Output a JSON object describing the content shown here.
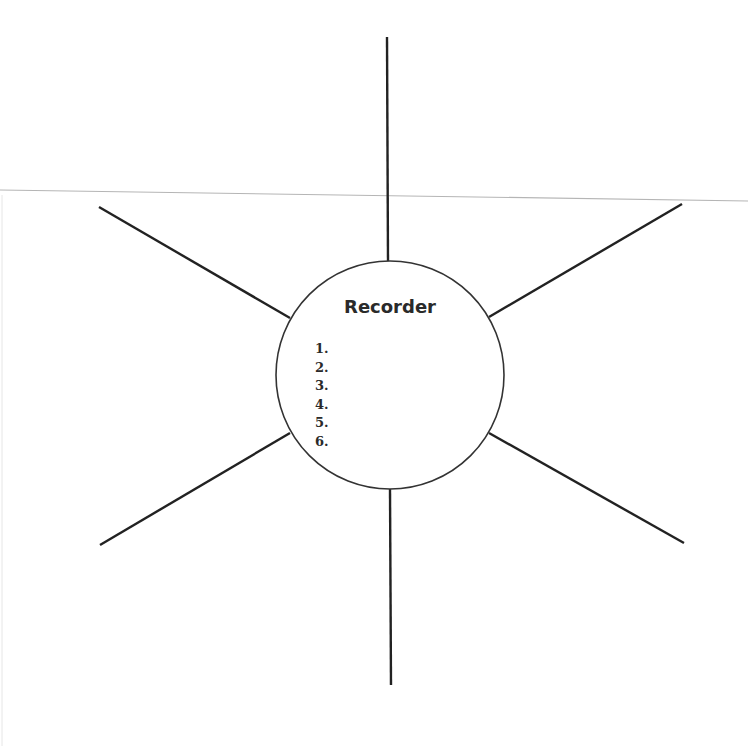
{
  "diagram": {
    "type": "graphic-organizer-web",
    "center": {
      "title": "Recorder",
      "items": [
        "1.",
        "2.",
        "3.",
        "4.",
        "5.",
        "6."
      ]
    },
    "spokes": [
      {
        "name": "top",
        "x1": 387,
        "y1": 37,
        "x2": 388,
        "y2": 261
      },
      {
        "name": "upper-right",
        "x1": 682,
        "y1": 204,
        "x2": 489,
        "y2": 317
      },
      {
        "name": "lower-right",
        "x1": 684,
        "y1": 543,
        "x2": 489,
        "y2": 433
      },
      {
        "name": "bottom",
        "x1": 390,
        "y1": 489,
        "x2": 391,
        "y2": 685
      },
      {
        "name": "lower-left",
        "x1": 100,
        "y1": 545,
        "x2": 290,
        "y2": 433
      },
      {
        "name": "upper-left",
        "x1": 99,
        "y1": 207,
        "x2": 290,
        "y2": 318
      }
    ],
    "circle": {
      "cx": 390,
      "cy": 375,
      "r": 114
    },
    "colors": {
      "stroke": "#222222",
      "scan_line": "#b5b5b5"
    }
  }
}
